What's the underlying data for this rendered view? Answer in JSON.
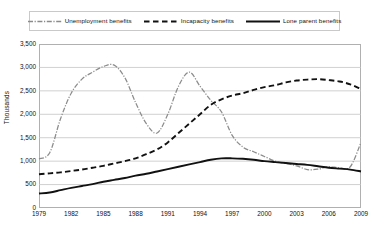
{
  "chart_data": {
    "type": "line",
    "title": "",
    "xlabel": "",
    "ylabel": "Thousands",
    "xlim": [
      1979,
      2009
    ],
    "ylim": [
      0,
      3500
    ],
    "ytick_step": 500,
    "grid": true,
    "legend_position": "top",
    "yticks": [
      "0",
      "500",
      "1,000",
      "1,500",
      "2,000",
      "2,500",
      "3,000",
      "3,500"
    ],
    "ytick_values": [
      0,
      500,
      1000,
      1500,
      2000,
      2500,
      3000,
      3500
    ],
    "xticks": [
      "1979",
      "1982",
      "1985",
      "1988",
      "1991",
      "1994",
      "1997",
      "2000",
      "2003",
      "2006",
      "2009"
    ],
    "xtick_values": [
      1979,
      1982,
      1985,
      1988,
      1991,
      1994,
      1997,
      2000,
      2003,
      2006,
      2009
    ],
    "x": [
      1979,
      1980,
      1981,
      1982,
      1983,
      1984,
      1985,
      1986,
      1987,
      1988,
      1989,
      1990,
      1991,
      1992,
      1993,
      1994,
      1995,
      1996,
      1997,
      1998,
      1999,
      2000,
      2001,
      2002,
      2003,
      2004,
      2005,
      2006,
      2007,
      2008,
      2009
    ],
    "series": [
      {
        "name": "Unemployment benefits",
        "style": "dash-dot",
        "color": "#8c8c8c",
        "values": [
          1050,
          1180,
          1900,
          2450,
          2750,
          2900,
          3020,
          3050,
          2780,
          2250,
          1800,
          1600,
          2000,
          2600,
          2900,
          2600,
          2300,
          2050,
          1550,
          1300,
          1200,
          1100,
          1000,
          950,
          900,
          820,
          830,
          880,
          860,
          880,
          1400
        ]
      },
      {
        "name": "Incapacity benefits",
        "style": "dashed",
        "color": "#111111",
        "values": [
          720,
          740,
          760,
          790,
          820,
          860,
          900,
          950,
          1000,
          1060,
          1150,
          1250,
          1400,
          1600,
          1800,
          2000,
          2200,
          2320,
          2400,
          2450,
          2520,
          2580,
          2620,
          2680,
          2720,
          2740,
          2750,
          2730,
          2700,
          2640,
          2540
        ]
      },
      {
        "name": "Lone parent benefits",
        "style": "solid",
        "color": "#111111",
        "values": [
          310,
          330,
          380,
          430,
          470,
          510,
          560,
          600,
          640,
          690,
          730,
          780,
          830,
          880,
          930,
          980,
          1030,
          1060,
          1060,
          1050,
          1030,
          1000,
          980,
          960,
          940,
          920,
          890,
          860,
          840,
          820,
          780
        ]
      }
    ]
  }
}
